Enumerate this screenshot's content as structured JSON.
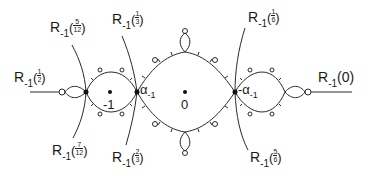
{
  "figure": {
    "rays": [
      {
        "id": "r-1-2",
        "R": "R",
        "sub": "-1",
        "num": "1",
        "den": "2",
        "type": "fraction"
      },
      {
        "id": "r-5-12",
        "R": "R",
        "sub": "-1",
        "num": "5",
        "den": "12",
        "type": "fraction"
      },
      {
        "id": "r-7-12",
        "R": "R",
        "sub": "-1",
        "num": "7",
        "den": "12",
        "type": "fraction"
      },
      {
        "id": "r-1-3",
        "R": "R",
        "sub": "-1",
        "num": "1",
        "den": "3",
        "type": "fraction"
      },
      {
        "id": "r-2-3",
        "R": "R",
        "sub": "-1",
        "num": "2",
        "den": "3",
        "type": "fraction"
      },
      {
        "id": "r-1-6",
        "R": "R",
        "sub": "-1",
        "num": "1",
        "den": "6",
        "type": "fraction"
      },
      {
        "id": "r-5-6",
        "R": "R",
        "sub": "-1",
        "num": "5",
        "den": "6",
        "type": "fraction"
      },
      {
        "id": "r-0",
        "R": "R",
        "sub": "-1",
        "arg": "(0)",
        "type": "plain"
      }
    ],
    "points": {
      "minus_one": "-1",
      "zero": "0",
      "alpha": "α",
      "alpha_sub": "-1",
      "neg_alpha": "-α",
      "neg_alpha_sub": "-1"
    }
  }
}
